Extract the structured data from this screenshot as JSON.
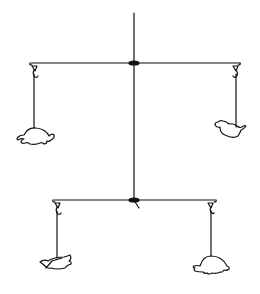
{
  "figure": {
    "description": "Line drawing of a two-tier hanging mobile",
    "stroke_color": "#111111",
    "background": "#ffffff",
    "tiers": [
      {
        "name": "upper",
        "left_item": "turtle",
        "right_item": "bird"
      },
      {
        "name": "lower",
        "left_item": "paper boat",
        "right_item": "turtle"
      }
    ]
  }
}
